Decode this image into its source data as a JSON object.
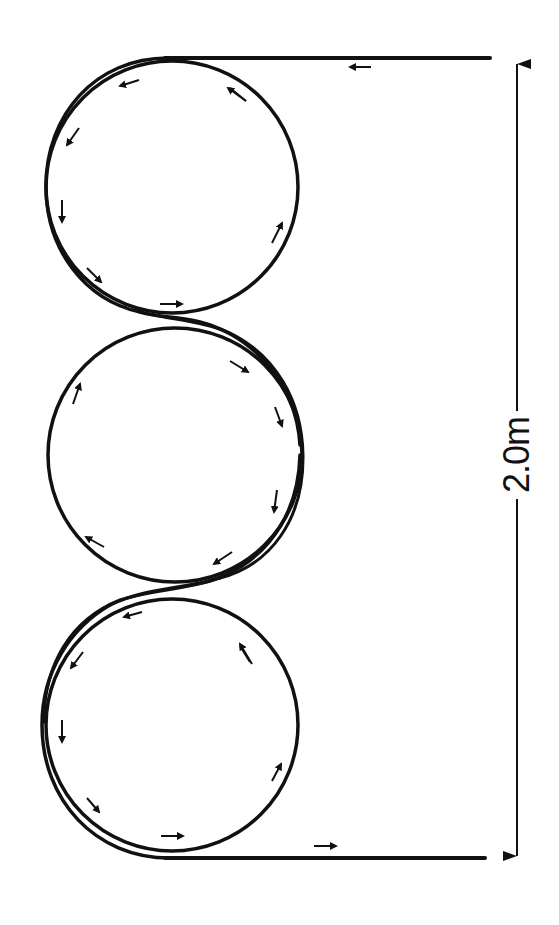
{
  "diagram": {
    "title": "",
    "stroke_color": "#111111",
    "background": "#ffffff",
    "dimension": {
      "label": "2.0m",
      "orientation": "vertical",
      "spans": "top straight to bottom straight"
    },
    "circles": [
      {
        "name": "top-circle",
        "cx": 172,
        "cy": 186,
        "r": 127
      },
      {
        "name": "middle-circle",
        "cx": 175,
        "cy": 455,
        "r": 128
      },
      {
        "name": "bottom-circle",
        "cx": 172,
        "cy": 725,
        "r": 127
      }
    ],
    "straights": [
      {
        "name": "entry-straight",
        "y": 58,
        "x_from": 490,
        "x_to": 160,
        "direction": "left"
      },
      {
        "name": "exit-straight",
        "y": 858,
        "x_from": 165,
        "x_to": 485,
        "direction": "right"
      }
    ],
    "direction_arrows_count": 25
  }
}
